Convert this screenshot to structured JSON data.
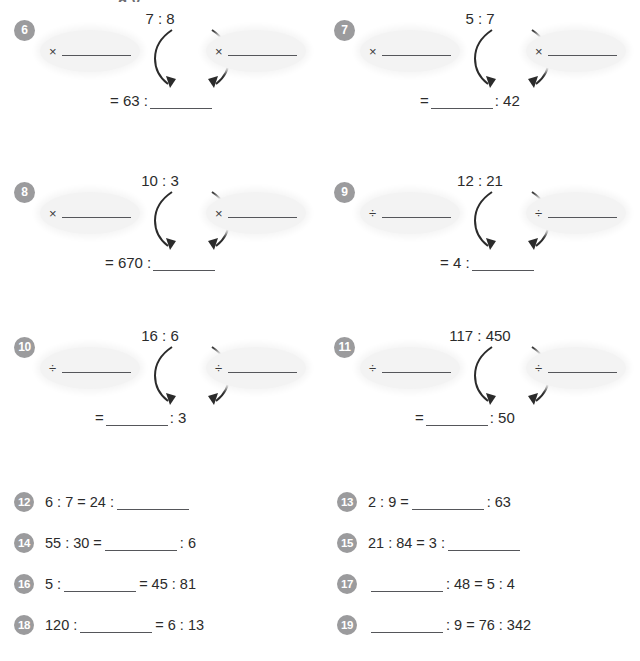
{
  "page": {
    "top_cut_text": "g                                      y",
    "badge_color": "#9b9b9d",
    "oval_fill": "#f3f3f3",
    "ink_color": "#2b2b2b"
  },
  "diagrams": [
    {
      "number": "6",
      "left_oval": {
        "operator": "×",
        "value": ""
      },
      "right_oval": {
        "operator": "×",
        "value": ""
      },
      "ratio_top": "7 : 8",
      "result_prefix": "= 63 :",
      "result_suffix": "",
      "blank_side": "right"
    },
    {
      "number": "7",
      "left_oval": {
        "operator": "×",
        "value": ""
      },
      "right_oval": {
        "operator": "×",
        "value": ""
      },
      "ratio_top": "5 : 7",
      "result_prefix": "=",
      "result_suffix": ": 42",
      "blank_side": "middle"
    },
    {
      "number": "8",
      "left_oval": {
        "operator": "×",
        "value": ""
      },
      "right_oval": {
        "operator": "×",
        "value": ""
      },
      "ratio_top": "10 : 3",
      "result_prefix": "= 670 :",
      "result_suffix": "",
      "blank_side": "right"
    },
    {
      "number": "9",
      "left_oval": {
        "operator": "÷",
        "value": ""
      },
      "right_oval": {
        "operator": "÷",
        "value": ""
      },
      "ratio_top": "12 : 21",
      "result_prefix": "= 4 :",
      "result_suffix": "",
      "blank_side": "right"
    },
    {
      "number": "10",
      "left_oval": {
        "operator": "÷",
        "value": ""
      },
      "right_oval": {
        "operator": "÷",
        "value": ""
      },
      "ratio_top": "16 : 6",
      "result_prefix": "=",
      "result_suffix": ": 3",
      "blank_side": "middle"
    },
    {
      "number": "11",
      "left_oval": {
        "operator": "÷",
        "value": ""
      },
      "right_oval": {
        "operator": "÷",
        "value": ""
      },
      "ratio_top": "117 : 450",
      "result_prefix": "=",
      "result_suffix": ": 50",
      "blank_side": "middle"
    }
  ],
  "equations": [
    {
      "number": "12",
      "prefix": "6 : 7 = 24 :",
      "suffix": ""
    },
    {
      "number": "13",
      "prefix": "2 : 9 =",
      "suffix": ": 63"
    },
    {
      "number": "14",
      "prefix": "55 : 30 =",
      "suffix": ": 6"
    },
    {
      "number": "15",
      "prefix": "21 : 84 = 3 :",
      "suffix": ""
    },
    {
      "number": "16",
      "prefix": "5 :",
      "suffix": "= 45 : 81"
    },
    {
      "number": "17",
      "prefix": "",
      "suffix": ": 48 = 5 : 4"
    },
    {
      "number": "18",
      "prefix": "120 :",
      "suffix": "= 6 : 13"
    },
    {
      "number": "19",
      "prefix": "",
      "suffix": ": 9 = 76 : 342"
    }
  ]
}
